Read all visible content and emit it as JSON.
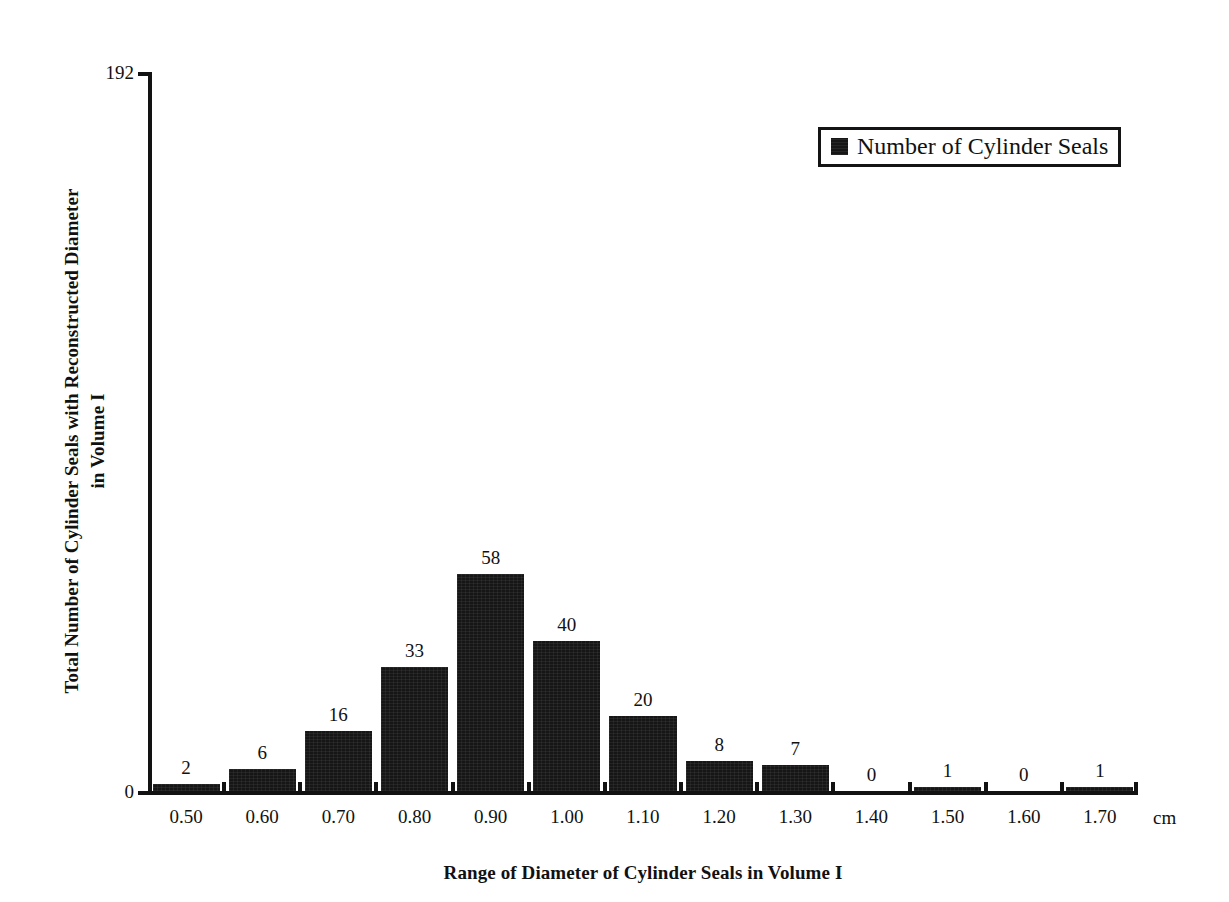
{
  "chart_data": {
    "type": "bar",
    "title": "",
    "xlabel": "Range of Diameter of Cylinder Seals in Volume I",
    "ylabel": "Total Number of Cylinder Seals with Reconstructed Diameter\nin Volume I",
    "x_unit_label": "cm",
    "categories": [
      "0.50",
      "0.60",
      "0.70",
      "0.80",
      "0.90",
      "1.00",
      "1.10",
      "1.20",
      "1.30",
      "1.40",
      "1.50",
      "1.60",
      "1.70"
    ],
    "values": [
      2,
      6,
      16,
      33,
      58,
      40,
      20,
      8,
      7,
      0,
      1,
      0,
      1
    ],
    "value_labels": [
      "2",
      "6",
      "16",
      "33",
      "58",
      "40",
      "20",
      "8",
      "7",
      "0",
      "1",
      "0",
      "1"
    ],
    "ylim": [
      0,
      192
    ],
    "y_tick_labels": [
      "0",
      "192"
    ],
    "grid": false,
    "legend_position": "top-right",
    "series": [
      {
        "name": "Number of Cylinder Seals",
        "color": "#161616",
        "values": [
          2,
          6,
          16,
          33,
          58,
          40,
          20,
          8,
          7,
          0,
          1,
          0,
          1
        ]
      }
    ]
  },
  "legend": {
    "label": "Number of Cylinder Seals",
    "swatch_color": "#161616"
  },
  "axes": {
    "y_max_label": "192",
    "y_zero_label": "0",
    "axis_color": "#121212"
  }
}
